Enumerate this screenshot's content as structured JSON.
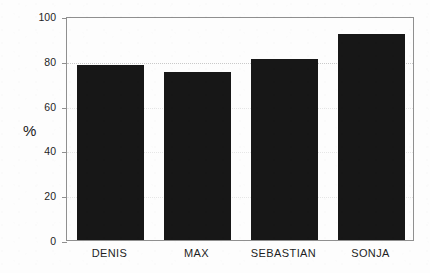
{
  "chart_data": {
    "type": "bar",
    "title": "",
    "xlabel": "",
    "ylabel": "%",
    "categories": [
      "DENIS",
      "MAX",
      "SEBASTIAN",
      "SONJA"
    ],
    "values": [
      78,
      75,
      81,
      92
    ],
    "ylim": [
      0,
      100
    ],
    "yticks": [
      0,
      20,
      40,
      60,
      80,
      100
    ],
    "ytick_labels": [
      "0",
      "20",
      "40",
      "60",
      "80",
      "100"
    ],
    "grid": true,
    "grid_axis": "y",
    "legend": false,
    "orientation": "vertical",
    "bar_color": "#171717",
    "series": [
      {
        "name": "%",
        "values": [
          78,
          75,
          81,
          92
        ]
      }
    ]
  },
  "figure": {
    "background_color": "#fdfdfd",
    "frame_color": "#8f8f8f",
    "grid_color": "#c9c9c9",
    "text_color": "#1f1f1f"
  }
}
